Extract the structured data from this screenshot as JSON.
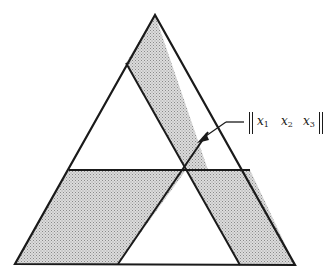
{
  "diagram": {
    "type": "triangle-partition",
    "colors": {
      "line": "#1a1a1a",
      "shade": "#c8c8c8",
      "background": "#ffffff"
    },
    "vertices": {
      "apex": [
        155,
        15
      ],
      "bottom_left": [
        15,
        263
      ],
      "bottom_right": [
        295,
        265
      ]
    },
    "intersection_point": [
      186,
      170
    ],
    "annotation": {
      "open_bracket": "‖",
      "close_bracket": "‖",
      "terms": [
        {
          "var": "x",
          "sub": "1"
        },
        {
          "var": "x",
          "sub": "2"
        },
        {
          "var": "x",
          "sub": "3"
        }
      ],
      "arrow_target": [
        197,
        143
      ]
    }
  }
}
